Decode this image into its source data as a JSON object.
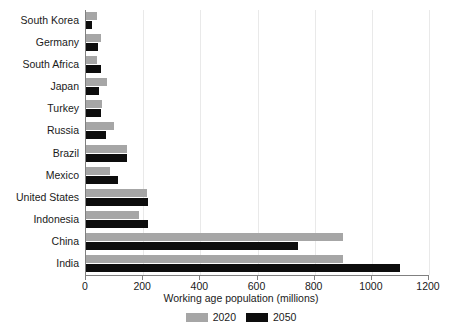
{
  "chart_data": {
    "type": "bar",
    "orientation": "horizontal",
    "title": "",
    "xlabel": "Working age population (millions)",
    "ylabel": "",
    "xlim": [
      0,
      1200
    ],
    "xticks": [
      0,
      200,
      400,
      600,
      800,
      1000,
      1200
    ],
    "xtick_labels": [
      "0",
      "200",
      "400",
      "600",
      "800",
      "1000",
      "1200"
    ],
    "grid": true,
    "grid_axis": "x",
    "legend_position": "bottom",
    "categories": [
      "South Korea",
      "Germany",
      "South Africa",
      "Japan",
      "Turkey",
      "Russia",
      "Brazil",
      "Mexico",
      "United States",
      "Indonesia",
      "China",
      "India"
    ],
    "series": [
      {
        "name": "2020",
        "color": "#a6a6a6",
        "values": [
          38,
          54,
          38,
          74,
          56,
          99,
          145,
          85,
          212,
          185,
          900,
          900
        ]
      },
      {
        "name": "2050",
        "color": "#0d0d0d",
        "values": [
          22,
          41,
          52,
          47,
          54,
          71,
          145,
          113,
          218,
          218,
          740,
          1100
        ]
      }
    ]
  },
  "axis": {
    "x_title": "Working age population (millions)"
  },
  "legend": {
    "items": [
      {
        "label": "2020",
        "color": "#a6a6a6"
      },
      {
        "label": "2050",
        "color": "#0d0d0d"
      }
    ]
  }
}
